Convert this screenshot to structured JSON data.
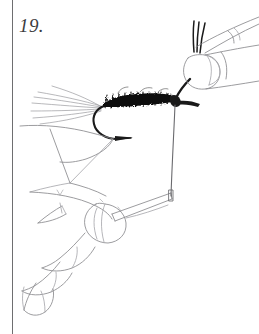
{
  "figure": {
    "number_label": "19.",
    "caption": "",
    "medium": "pen-and-ink line drawing"
  },
  "page": {
    "width": 259,
    "height": 334,
    "background_color": "#ffffff",
    "margin_rule_color": "#6e6e70",
    "margin_rule_x": 12
  },
  "colors": {
    "ink_dark": "#1a1a1a",
    "ink_body": "#111111",
    "ink_outline": "#8a8a8e",
    "ink_outline_light": "#a9a9ad",
    "ink_hair": "#9a9a9e",
    "number_text": "#3c3c3e",
    "background": "#ffffff"
  },
  "artwork": {
    "elements": [
      {
        "name": "fly-body-dubbing",
        "description": "dark textured dubbed body along the hook shank",
        "color": "#111111",
        "x_range": [
          100,
          172
        ],
        "y_range": [
          96,
          108
        ]
      },
      {
        "name": "tail-fibers",
        "description": "splayed thin tail fibers fanning to the upper left",
        "color": "#9a9a9e",
        "count": 7,
        "origin": [
          100,
          108
        ]
      },
      {
        "name": "hook-bend",
        "description": "hook curving down and left below the body",
        "color": "#1a1a1a"
      },
      {
        "name": "hook-eye-wraps",
        "description": "dark thread wraps at the hook eye on the right",
        "color": "#1a1a1a",
        "position": [
          174,
          99
        ]
      },
      {
        "name": "thread-vertical",
        "description": "tying thread hanging vertically from the hook eye to the lower hand",
        "color": "#6a6a6e",
        "from": [
          174,
          104
        ],
        "to": [
          171,
          196
        ]
      },
      {
        "name": "thread-strands-top",
        "description": "three dark thread strands rising from the upper fingertip",
        "color": "#1a1a1a",
        "count": 3
      },
      {
        "name": "upper-right-hand",
        "description": "fingertip with fingernail holding the thread, upper right",
        "color": "#8a8a8e"
      },
      {
        "name": "mid-left-finger",
        "description": "finger and thumb outline at mid left supporting the fly",
        "color": "#8a8a8e"
      },
      {
        "name": "lower-left-hand",
        "description": "hand with four fingers at lower left holding the bobbin",
        "color": "#8a8a8e"
      },
      {
        "name": "bobbin-tool",
        "description": "slim tool held between the lower fingers receiving the thread",
        "color": "#8a8a8e"
      }
    ]
  }
}
